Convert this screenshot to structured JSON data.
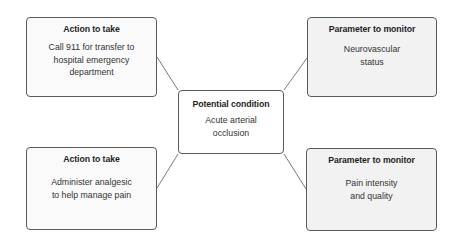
{
  "diagram": {
    "center": {
      "title": "Potential condition",
      "line1": "Acute arterial",
      "line2": "occlusion"
    },
    "top_left": {
      "title": "Action to take",
      "line1": "Call 911 for transfer to",
      "line2": "hospital emergency",
      "line3": "department"
    },
    "bottom_left": {
      "title": "Action to take",
      "line1": "Administer analgesic",
      "line2": "to help manage pain"
    },
    "top_right": {
      "title": "Parameter to monitor",
      "line1": "Neurovascular",
      "line2": "status"
    },
    "bottom_right": {
      "title": "Parameter to monitor",
      "line1": "Pain intensity",
      "line2": "and quality"
    },
    "colors": {
      "border": "#5a5a5a",
      "action_fill": "#fafafa",
      "parameter_fill": "#f2f2f2",
      "center_fill": "#ffffff",
      "connector": "#6a6a6a"
    }
  }
}
